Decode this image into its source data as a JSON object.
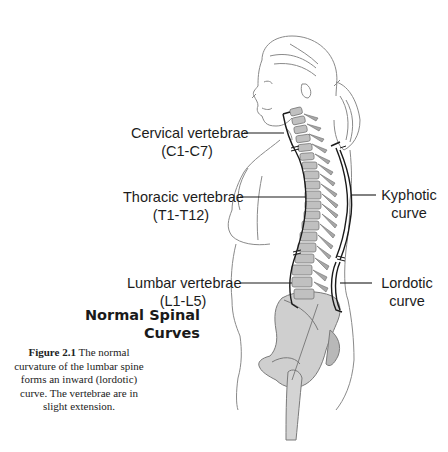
{
  "labels": {
    "cervical": {
      "name": "Cervical vertebrae",
      "range": "(C1-C7)"
    },
    "thoracic": {
      "name": "Thoracic vertebrae",
      "range": "(T1-T12)"
    },
    "lumbar": {
      "name": "Lumbar vertebrae",
      "range": "(L1-L5)"
    },
    "kyphotic": {
      "line1": "Kyphotic",
      "line2": "curve"
    },
    "lordotic": {
      "line1": "Lordotic",
      "line2": "curve"
    }
  },
  "title": {
    "line1": "Normal Spinal",
    "line2": "Curves"
  },
  "caption": {
    "figure_number": "Figure 2.1",
    "text": "The normal curvature of the lumbar spine forms an inward (lordotic) curve. The vertebrae are in slight extension."
  },
  "colors": {
    "line": "#1a1a1a",
    "outline": "#8a8a8a",
    "bone": "#c8c8c8",
    "bone_dark": "#9a9a9a",
    "background": "#ffffff"
  }
}
